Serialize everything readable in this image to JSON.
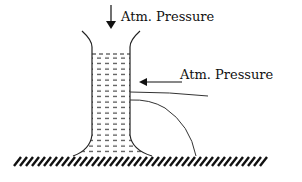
{
  "diagram": {
    "type": "physics-diagram",
    "labels": {
      "top_pressure": "Atm. Pressure",
      "side_pressure": "Atm. Pressure"
    },
    "colors": {
      "line": "#111111",
      "background": "#ffffff"
    }
  }
}
